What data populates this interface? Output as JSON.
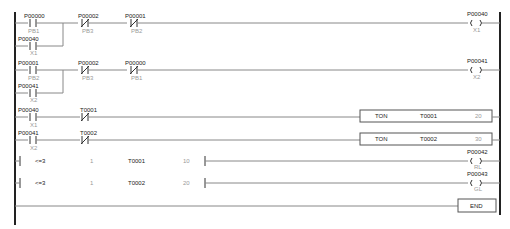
{
  "diagram": {
    "type": "ladder-logic",
    "rungs": [
      {
        "id": 1,
        "contacts": [
          {
            "address": "P00000",
            "label": "PB1",
            "type": "NO",
            "branch": 0
          },
          {
            "address": "P00040",
            "label": "X1",
            "type": "NO",
            "branch": 1
          },
          {
            "address": "P00002",
            "label": "PB3",
            "type": "NC",
            "branch": 0
          },
          {
            "address": "P00001",
            "label": "PB2",
            "type": "NC",
            "branch": 0
          }
        ],
        "output": {
          "kind": "coil",
          "address": "P00040",
          "label": "X1"
        }
      },
      {
        "id": 2,
        "contacts": [
          {
            "address": "P00001",
            "label": "PB2",
            "type": "NO",
            "branch": 0
          },
          {
            "address": "P00041",
            "label": "X2",
            "type": "NO",
            "branch": 1
          },
          {
            "address": "P00002",
            "label": "PB3",
            "type": "NC",
            "branch": 0
          },
          {
            "address": "P00000",
            "label": "PB1",
            "type": "NC",
            "branch": 0
          }
        ],
        "output": {
          "kind": "coil",
          "address": "P00041",
          "label": "X2"
        }
      },
      {
        "id": 3,
        "contacts": [
          {
            "address": "P00040",
            "label": "X1",
            "type": "NO"
          },
          {
            "address": "T0001",
            "label": "",
            "type": "NC"
          }
        ],
        "output": {
          "kind": "function",
          "name": "TON",
          "operand": "T0001",
          "preset": "20"
        }
      },
      {
        "id": 4,
        "contacts": [
          {
            "address": "P00041",
            "label": "X2",
            "type": "NO"
          },
          {
            "address": "T0002",
            "label": "",
            "type": "NC"
          }
        ],
        "output": {
          "kind": "function",
          "name": "TON",
          "operand": "T0002",
          "preset": "30"
        }
      },
      {
        "id": 5,
        "compare": {
          "op": "<=3",
          "size": "1",
          "operand": "T0001",
          "value": "10"
        },
        "output": {
          "kind": "coil",
          "address": "P00042",
          "label": "RL"
        }
      },
      {
        "id": 6,
        "compare": {
          "op": "<=3",
          "size": "1",
          "operand": "T0002",
          "value": "20"
        },
        "output": {
          "kind": "coil",
          "address": "P00043",
          "label": "GL"
        }
      },
      {
        "id": 7,
        "output": {
          "kind": "end",
          "name": "END"
        }
      }
    ]
  }
}
